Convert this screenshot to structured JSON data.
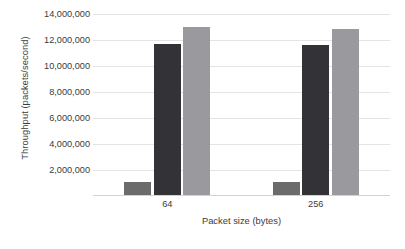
{
  "chart_data": {
    "type": "bar",
    "title": "",
    "xlabel": "Packet size (bytes)",
    "ylabel": "Throughput (packets/second)",
    "categories": [
      "64",
      "256"
    ],
    "ylim": [
      0,
      14000000
    ],
    "yticks": [
      0,
      2000000,
      4000000,
      6000000,
      8000000,
      10000000,
      12000000,
      14000000
    ],
    "ytick_labels": [
      "",
      "2,000,000",
      "4,000,000",
      "6,000,000",
      "8,000,000",
      "10,000,000",
      "12,000,000",
      "14,000,000"
    ],
    "grid": true,
    "legend": "none",
    "series": [
      {
        "name": "series-1",
        "color": "#6b6b6b",
        "values": [
          1080000,
          1080000
        ]
      },
      {
        "name": "series-2",
        "color": "#333337",
        "values": [
          11700000,
          11600000
        ]
      },
      {
        "name": "series-3",
        "color": "#9a9a9e",
        "values": [
          13000000,
          12850000
        ]
      }
    ]
  }
}
